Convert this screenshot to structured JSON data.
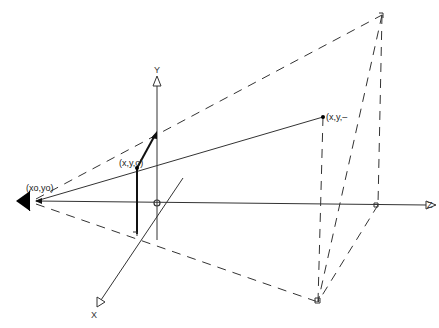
{
  "diagram": {
    "type": "perspective-projection",
    "labels": {
      "eye": "(x₀,y₀)",
      "eye_display": "(xo,yo)",
      "projected_point": "(x,y₀)",
      "projected_point_display": "(x,y,o)",
      "object_point": "(x,y,...",
      "object_point_display": "(x,y,–",
      "axis_y": "Y",
      "axis_z": "Z",
      "axis_x": "X"
    },
    "colors": {
      "line": "#333333",
      "background": "#ffffff",
      "eye": "#000000"
    },
    "points": {
      "eye": [
        33,
        201
      ],
      "origin": [
        157,
        203
      ],
      "projected_point": [
        137,
        168
      ],
      "object_point": [
        323,
        117
      ],
      "far_top": [
        382,
        15
      ],
      "far_bottom": [
        318,
        302
      ],
      "near_bottom": [
        137,
        234
      ],
      "z_end": [
        433,
        205
      ],
      "y_top": [
        157,
        76
      ],
      "x_end": [
        97,
        307
      ]
    }
  }
}
